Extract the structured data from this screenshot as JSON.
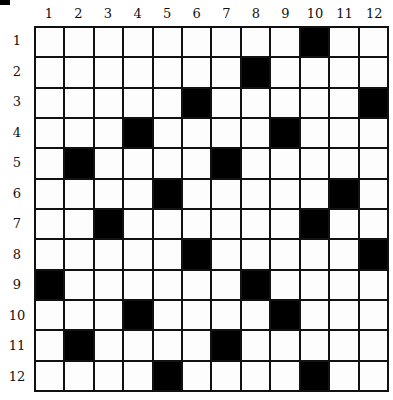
{
  "puzzle": {
    "type": "crossword-grid",
    "rows": 12,
    "cols": 12,
    "column_labels": [
      "1",
      "2",
      "3",
      "4",
      "5",
      "6",
      "7",
      "8",
      "9",
      "10",
      "11",
      "12"
    ],
    "row_labels": [
      "1",
      "2",
      "3",
      "4",
      "5",
      "6",
      "7",
      "8",
      "9",
      "10",
      "11",
      "12"
    ],
    "black_cells": {
      "1": [
        10
      ],
      "2": [
        8
      ],
      "3": [
        6,
        12
      ],
      "4": [
        4,
        9
      ],
      "5": [
        2,
        7
      ],
      "6": [
        5,
        11
      ],
      "7": [
        3,
        10
      ],
      "8": [
        6,
        12
      ],
      "9": [
        1,
        8
      ],
      "10": [
        4,
        9
      ],
      "11": [
        2,
        7
      ],
      "12": [
        5,
        10
      ]
    },
    "colors": {
      "black": "#000000",
      "white": "#fdfdfd",
      "line": "#111111"
    }
  }
}
